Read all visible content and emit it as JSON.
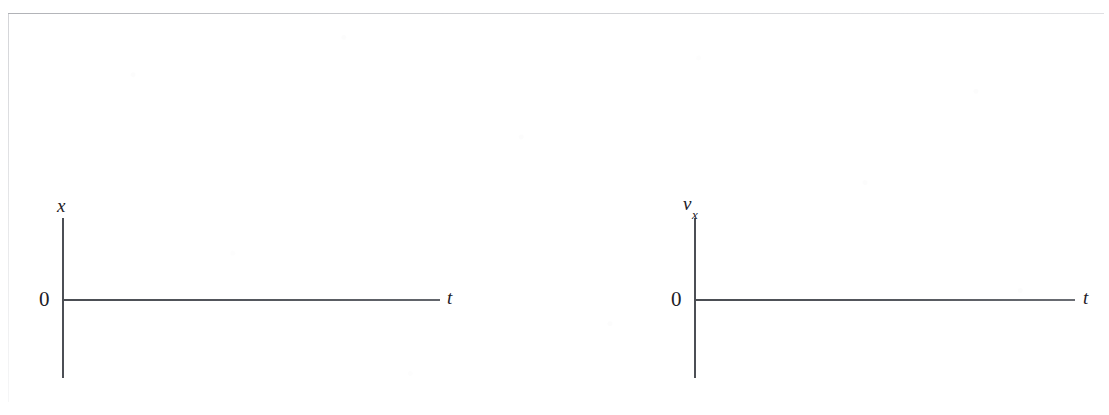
{
  "page": {
    "background_color": "#ffffff",
    "ink_color": "#1d2026",
    "axis_color": "#4c4f55",
    "frame_color": "#b0b2b8",
    "clipped_header_text": ""
  },
  "graphs": [
    {
      "id": "position-vs-time",
      "name": "position-time-graph",
      "vertical_axis_label": "x",
      "vertical_axis_subscript": "",
      "horizontal_axis_label": "t",
      "origin_label": "0",
      "curve": "none"
    },
    {
      "id": "velocity-vs-time",
      "name": "velocity-time-graph",
      "vertical_axis_label": "v",
      "vertical_axis_subscript": "x",
      "horizontal_axis_label": "t",
      "origin_label": "0",
      "curve": "none"
    }
  ]
}
